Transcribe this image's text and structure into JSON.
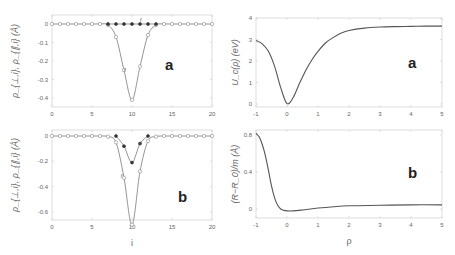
{
  "chart_data": [
    {
      "id": "top-left",
      "type": "line",
      "panel_label": "a",
      "xlabel": "",
      "ylabel": "ρ_{⊥,i}, ρ_{∥,i} (Å)",
      "xlim": [
        0,
        20
      ],
      "ylim": [
        -0.45,
        0.03
      ],
      "xticks": [
        0,
        5,
        10,
        15,
        20
      ],
      "yticks": [
        0,
        -0.1,
        -0.2,
        -0.3,
        -0.4
      ],
      "ytick_labels": [
        "0",
        "-0.1",
        "-0.2",
        "-0.3",
        "-0.4"
      ],
      "annotations": [
        {
          "text": "f",
          "x": 11,
          "y": 0.01
        },
        {
          "text": "f",
          "x": 9,
          "y": -0.26
        }
      ],
      "series": [
        {
          "name": "open circles (ρ_⊥)",
          "marker": "open-circle",
          "x": [
            0,
            1,
            2,
            3,
            4,
            5,
            6,
            7,
            8,
            9,
            10,
            11,
            12,
            13,
            14,
            15,
            16,
            17,
            18,
            19,
            20
          ],
          "y": [
            0,
            0,
            0,
            0,
            0,
            0,
            0,
            -0.005,
            -0.07,
            -0.25,
            -0.41,
            -0.23,
            -0.06,
            -0.005,
            0,
            0,
            0,
            0,
            0,
            0,
            0
          ]
        },
        {
          "name": "filled circles (ρ_∥)",
          "marker": "filled-circle",
          "x": [
            7,
            8,
            9,
            10,
            11,
            12,
            13
          ],
          "y": [
            0,
            0,
            0,
            0,
            0,
            0,
            0
          ]
        }
      ]
    },
    {
      "id": "bottom-left",
      "type": "line",
      "panel_label": "b",
      "xlabel": "i",
      "ylabel": "ρ_{⊥,i}, ρ_{∥,i} (Å)",
      "xlim": [
        0,
        20
      ],
      "ylim": [
        -0.75,
        0.05
      ],
      "xticks": [
        0,
        5,
        10,
        15,
        20
      ],
      "yticks": [
        0,
        -0.2,
        -0.4,
        -0.6
      ],
      "ytick_labels": [
        "0",
        "-0.2",
        "-0.4",
        "-0.6"
      ],
      "annotations": [
        {
          "text": "e",
          "x": 10.8,
          "y": -0.07
        },
        {
          "text": "f",
          "x": 8.6,
          "y": -0.33
        }
      ],
      "series": [
        {
          "name": "open circles (ρ_⊥)",
          "marker": "open-circle",
          "x": [
            0,
            1,
            2,
            3,
            4,
            5,
            6,
            7,
            8,
            9,
            10,
            11,
            12,
            13,
            14,
            15,
            16,
            17,
            18,
            19,
            20
          ],
          "y": [
            0,
            0,
            0,
            0,
            0,
            0,
            0,
            -0.005,
            -0.05,
            -0.33,
            -0.7,
            -0.28,
            -0.04,
            -0.005,
            0,
            0,
            0,
            0,
            0,
            0,
            0
          ]
        },
        {
          "name": "filled circles (ρ_∥)",
          "marker": "filled-circle",
          "x": [
            8,
            9,
            10,
            11,
            12
          ],
          "y": [
            0,
            -0.08,
            -0.21,
            -0.06,
            0
          ]
        }
      ]
    },
    {
      "id": "top-right",
      "type": "line",
      "panel_label": "a",
      "xlabel": "",
      "ylabel": "U_c(ρ) (eV)",
      "xlim": [
        -1,
        5
      ],
      "ylim": [
        0,
        4
      ],
      "xticks": [
        -1,
        0,
        1,
        2,
        3,
        4,
        5
      ],
      "yticks": [
        0,
        1,
        2,
        3,
        4
      ],
      "series": [
        {
          "name": "U_c",
          "x": [
            -1,
            -0.8,
            -0.6,
            -0.4,
            -0.2,
            0,
            0.2,
            0.4,
            0.6,
            0.8,
            1,
            1.25,
            1.5,
            1.75,
            2,
            2.5,
            3,
            3.5,
            4,
            4.5,
            5
          ],
          "y": [
            2.95,
            2.8,
            2.45,
            1.75,
            0.75,
            0.02,
            0.3,
            0.95,
            1.55,
            2.05,
            2.45,
            2.85,
            3.1,
            3.3,
            3.42,
            3.53,
            3.58,
            3.6,
            3.61,
            3.62,
            3.62
          ]
        }
      ]
    },
    {
      "id": "bottom-right",
      "type": "line",
      "panel_label": "b",
      "xlabel": "ρ",
      "ylabel": "(R−R_0)/m (Å)",
      "xlim": [
        -1,
        5
      ],
      "ylim": [
        -0.05,
        0.85
      ],
      "xticks": [
        -1,
        0,
        1,
        2,
        3,
        4,
        5
      ],
      "yticks": [
        0,
        0.4,
        0.8
      ],
      "series": [
        {
          "name": "(R−R0)/m",
          "x": [
            -1,
            -0.9,
            -0.8,
            -0.7,
            -0.6,
            -0.5,
            -0.4,
            -0.3,
            -0.2,
            -0.1,
            0,
            0.2,
            0.5,
            1,
            1.5,
            2,
            3,
            4,
            5
          ],
          "y": [
            0.82,
            0.78,
            0.7,
            0.58,
            0.42,
            0.25,
            0.12,
            0.04,
            0.0,
            -0.015,
            -0.02,
            -0.02,
            -0.01,
            0.01,
            0.025,
            0.035,
            0.04,
            0.045,
            0.045
          ]
        }
      ]
    }
  ]
}
